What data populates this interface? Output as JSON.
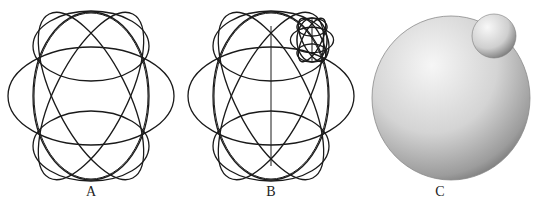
{
  "figure": {
    "panels": [
      {
        "id": "A",
        "label": "A",
        "description": "wireframe sphere outline of circles"
      },
      {
        "id": "B",
        "label": "B",
        "description": "wireframe sphere with small wireframe sphere attached and vertical axis"
      },
      {
        "id": "C",
        "label": "C",
        "description": "shaded sphere with small shaded sphere attached"
      }
    ],
    "colors": {
      "stroke": "#1a1a1a",
      "background": "#ffffff",
      "sphere_light": "#f4f4f4",
      "sphere_dark": "#8a8a8a"
    }
  }
}
